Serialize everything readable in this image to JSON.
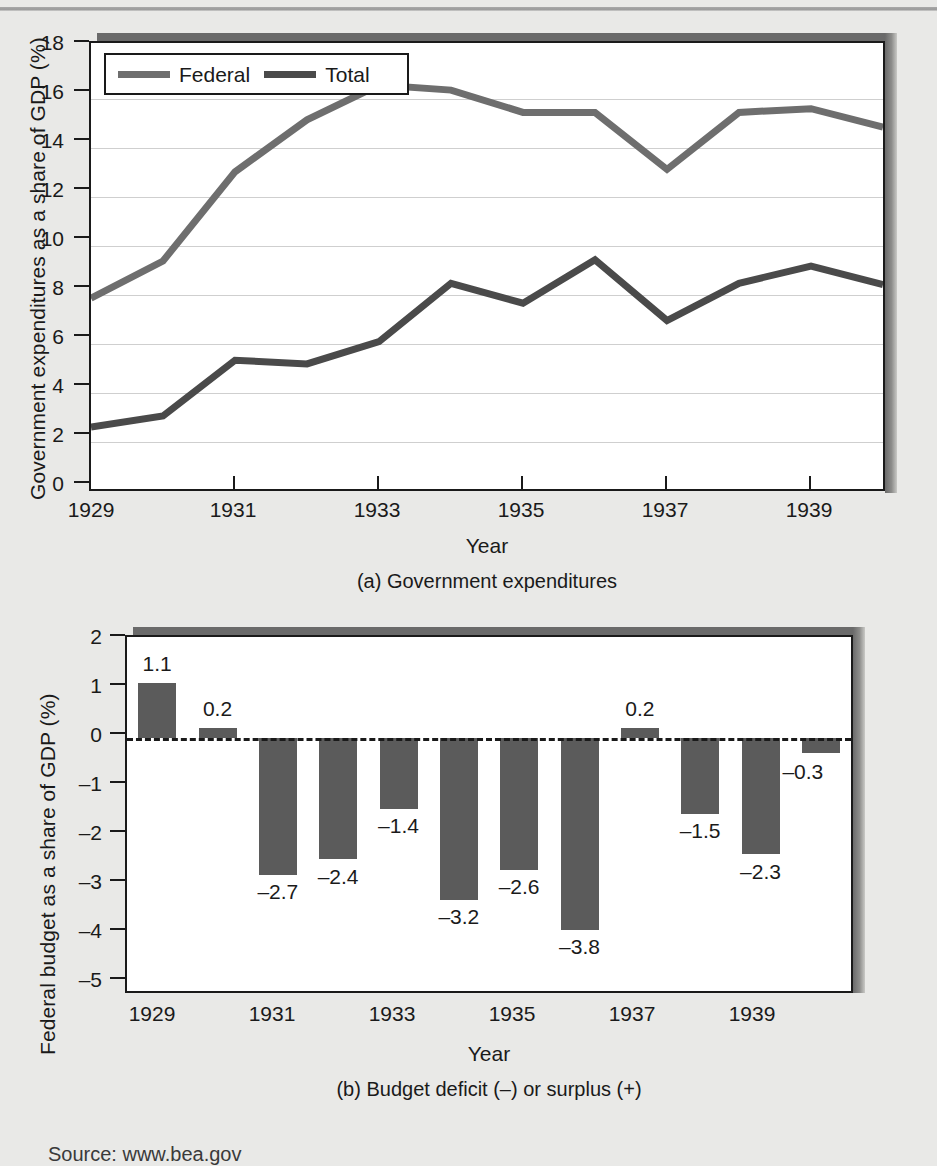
{
  "page": {
    "background_color": "#e9e9e7",
    "source_note": "Source: www.bea.gov"
  },
  "chart_data": [
    {
      "id": "panel-a",
      "type": "line",
      "title": "",
      "caption": "(a) Government expenditures",
      "xlabel": "Year",
      "ylabel": "Government expenditures as a share of GDP (%)",
      "x": [
        1929,
        1930,
        1931,
        1932,
        1933,
        1934,
        1935,
        1936,
        1937,
        1938,
        1939,
        1940
      ],
      "xlim": [
        1929,
        1940
      ],
      "ylim": [
        0,
        18
      ],
      "yticks": [
        "0",
        "2",
        "4",
        "6",
        "8",
        "10",
        "12",
        "14",
        "16",
        "18"
      ],
      "xticks": [
        "1929",
        "1931",
        "1933",
        "1935",
        "1937",
        "1939"
      ],
      "xtick_values": [
        1929,
        1931,
        1933,
        1935,
        1937,
        1939
      ],
      "grid": true,
      "legend_position": "top-left",
      "series": [
        {
          "name": "Federal",
          "color": "#6e6e6e",
          "values": [
            7.7,
            9.2,
            12.8,
            14.9,
            16.3,
            16.1,
            15.2,
            15.2,
            12.9,
            15.2,
            15.35,
            14.6
          ]
        },
        {
          "name": "Total",
          "color": "#4a4a4a",
          "values": [
            2.5,
            2.95,
            5.2,
            5.05,
            5.95,
            8.3,
            7.5,
            9.25,
            6.8,
            8.3,
            9.0,
            8.25
          ]
        }
      ]
    },
    {
      "id": "panel-b",
      "type": "bar",
      "title": "",
      "caption": "(b) Budget deficit (–) or surplus (+)",
      "xlabel": "Year",
      "ylabel": "Federal budget as a share of GDP (%)",
      "categories": [
        1929,
        1930,
        1931,
        1932,
        1933,
        1934,
        1935,
        1936,
        1937,
        1938,
        1939,
        1940
      ],
      "values": [
        1.1,
        0.2,
        -2.7,
        -2.4,
        -1.4,
        -3.2,
        -2.6,
        -3.8,
        0.2,
        -1.5,
        -2.3,
        -0.3
      ],
      "value_labels": [
        "1.1",
        "0.2",
        "–2.7",
        "–2.4",
        "–1.4",
        "–3.2",
        "–2.6",
        "–3.8",
        "0.2",
        "–1.5",
        "–2.3",
        "–0.3"
      ],
      "ylim": [
        -5,
        2
      ],
      "yticks": [
        "2",
        "1",
        "0",
        "–1",
        "–2",
        "–3",
        "–4",
        "–5"
      ],
      "ytick_values": [
        2,
        1,
        0,
        -1,
        -2,
        -3,
        -4,
        -5
      ],
      "xticks": [
        "1929",
        "1931",
        "1933",
        "1935",
        "1937",
        "1939"
      ],
      "xtick_values": [
        1929,
        1931,
        1933,
        1935,
        1937,
        1939
      ],
      "bar_color": "#5b5b5b",
      "grid": false,
      "zero_line": true,
      "legend_position": "none"
    }
  ]
}
